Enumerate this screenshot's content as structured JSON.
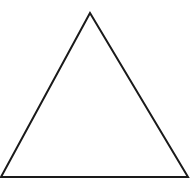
{
  "diagram": {
    "shape": "triangle",
    "type": "equilateral-outline",
    "vertices": [
      [
        90,
        13
      ],
      [
        1,
        177
      ],
      [
        188,
        177
      ]
    ],
    "stroke_color": "#1a1a1a",
    "fill_color": "none",
    "background_color": "#ffffff",
    "stroke_width": 2
  }
}
